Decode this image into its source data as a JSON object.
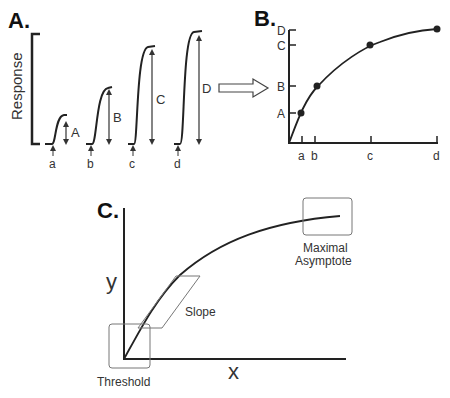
{
  "panel_a": {
    "label": "A.",
    "y_axis_label": "Response",
    "stimuli": [
      {
        "stimulus": "a",
        "response": "A"
      },
      {
        "stimulus": "b",
        "response": "B"
      },
      {
        "stimulus": "c",
        "response": "C"
      },
      {
        "stimulus": "d",
        "response": "D"
      }
    ]
  },
  "panel_b": {
    "label": "B.",
    "y_ticks": [
      "A",
      "B",
      "C",
      "D"
    ],
    "x_ticks": [
      "a",
      "b",
      "c",
      "d"
    ]
  },
  "panel_c": {
    "label": "C.",
    "y_axis_label": "y",
    "x_axis_label": "x",
    "annotations": {
      "threshold": "Threshold",
      "slope": "Slope",
      "asymptote_line1": "Maximal",
      "asymptote_line2": "Asymptote"
    }
  },
  "colors": {
    "line": "#222222",
    "box": "#777777"
  }
}
